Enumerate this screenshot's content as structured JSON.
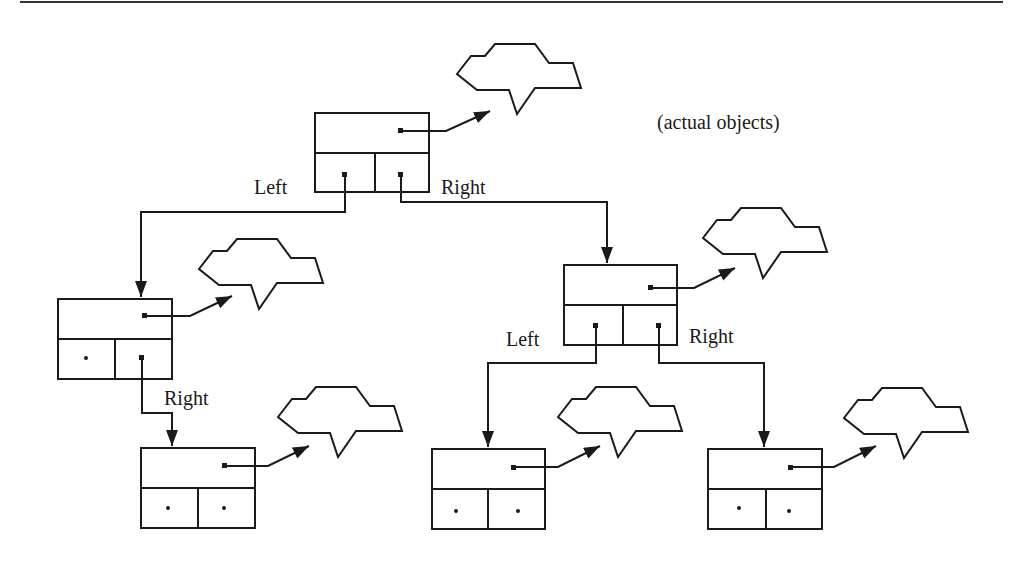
{
  "diagram": {
    "type": "binary-tree-of-references",
    "caption": "(actual objects)",
    "colors": {
      "ink": "#1a1a1a",
      "background": "#ffffff"
    },
    "labels": {
      "root_left": "Left",
      "root_right": "Right",
      "left_child_right": "Right",
      "right_child_left": "Left",
      "right_child_right": "Right"
    },
    "nodes": [
      {
        "id": "root",
        "left": "pointer",
        "right": "pointer",
        "object": "cloud"
      },
      {
        "id": "left-child",
        "left": "null",
        "right": "pointer",
        "object": "cloud"
      },
      {
        "id": "right-child",
        "left": "pointer",
        "right": "pointer",
        "object": "cloud"
      },
      {
        "id": "left-right-grandchild",
        "left": "null",
        "right": "null",
        "object": "cloud"
      },
      {
        "id": "right-left-grandchild",
        "left": "null",
        "right": "null",
        "object": "cloud"
      },
      {
        "id": "right-right-grandchild",
        "left": "null",
        "right": "null",
        "object": "cloud"
      }
    ]
  }
}
